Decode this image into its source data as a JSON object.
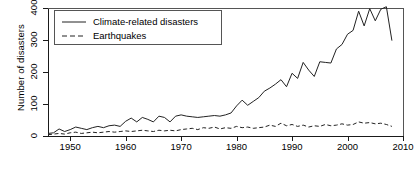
{
  "chart_data": {
    "type": "line",
    "title": "",
    "xlabel": "",
    "ylabel": "Number of disasters",
    "xlim": [
      1946,
      2010
    ],
    "ylim": [
      0,
      400
    ],
    "xticks": [
      1950,
      1960,
      1970,
      1980,
      1990,
      2000,
      2010
    ],
    "yticks": [
      0,
      100,
      200,
      300,
      400
    ],
    "xtick_labels": [
      "1950",
      "1960",
      "1970",
      "1980",
      "1990",
      "2000",
      "2010"
    ],
    "ytick_labels": [
      "0",
      "100",
      "200",
      "300",
      "400"
    ],
    "grid": false,
    "legend_position": "top-left",
    "x": [
      1946,
      1947,
      1948,
      1949,
      1950,
      1951,
      1952,
      1953,
      1954,
      1955,
      1956,
      1957,
      1958,
      1959,
      1960,
      1961,
      1962,
      1963,
      1964,
      1965,
      1966,
      1967,
      1968,
      1969,
      1970,
      1971,
      1972,
      1973,
      1974,
      1975,
      1976,
      1977,
      1978,
      1979,
      1980,
      1981,
      1982,
      1983,
      1984,
      1985,
      1986,
      1987,
      1988,
      1989,
      1990,
      1991,
      1992,
      1993,
      1994,
      1995,
      1996,
      1997,
      1998,
      1999,
      2000,
      2001,
      2002,
      2003,
      2004,
      2005,
      2006,
      2007,
      2008
    ],
    "series": [
      {
        "name": "Climate-related disasters",
        "style": "solid",
        "color": "#222222",
        "values": [
          8,
          10,
          22,
          14,
          20,
          28,
          24,
          20,
          26,
          30,
          26,
          32,
          34,
          30,
          46,
          56,
          44,
          58,
          52,
          44,
          62,
          58,
          44,
          62,
          66,
          62,
          60,
          58,
          60,
          62,
          64,
          62,
          66,
          72,
          94,
          112,
          96,
          108,
          120,
          140,
          150,
          162,
          176,
          154,
          196,
          180,
          230,
          206,
          186,
          232,
          230,
          228,
          272,
          286,
          318,
          330,
          390,
          344,
          398,
          360,
          396,
          404,
          298
        ]
      },
      {
        "name": "Earthquakes",
        "style": "dashed",
        "color": "#222222",
        "values": [
          4,
          6,
          8,
          6,
          10,
          12,
          8,
          10,
          12,
          10,
          12,
          14,
          12,
          14,
          16,
          14,
          16,
          18,
          16,
          14,
          18,
          16,
          18,
          16,
          20,
          22,
          24,
          20,
          26,
          24,
          28,
          22,
          26,
          24,
          30,
          26,
          28,
          24,
          26,
          28,
          34,
          30,
          40,
          32,
          36,
          30,
          34,
          28,
          32,
          30,
          36,
          32,
          34,
          38,
          34,
          36,
          44,
          40,
          42,
          38,
          40,
          36,
          30
        ]
      }
    ]
  },
  "legend": {
    "entries": [
      {
        "label": "Climate-related disasters",
        "style": "solid"
      },
      {
        "label": "Earthquakes",
        "style": "dashed"
      }
    ]
  }
}
